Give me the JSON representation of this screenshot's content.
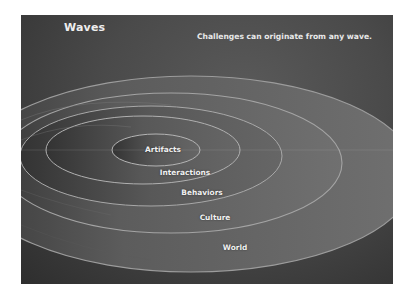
{
  "slide": {
    "title": "Waves",
    "subtitle": "Challenges can originate from any wave.",
    "colors": {
      "background": "#4a4a4a",
      "background_dark": "#2e2e2e",
      "ring_fill": "#6a6a6a",
      "ring_edge": "#a0a0a0",
      "text": "#f0f0f0"
    }
  },
  "waves": [
    {
      "label": "Artifacts"
    },
    {
      "label": "Interactions"
    },
    {
      "label": "Behaviors"
    },
    {
      "label": "Culture"
    },
    {
      "label": "World"
    }
  ]
}
